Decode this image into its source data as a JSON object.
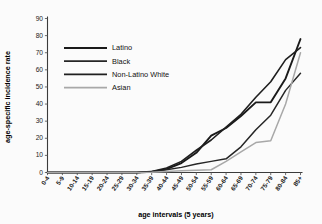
{
  "chart_data": {
    "type": "line",
    "title": "",
    "xlabel": "age intervals (5 years)",
    "ylabel": "age-specific incidence rate",
    "categories": [
      "0-4",
      "5-9",
      "10-14",
      "15-19",
      "20-24",
      "25-29",
      "30-34",
      "35-39",
      "40-44",
      "45-49",
      "50-54",
      "55-59",
      "60-64",
      "65-69",
      "70-74",
      "75-79",
      "80-84",
      "85+"
    ],
    "ylim": [
      0,
      90
    ],
    "yticks": [
      0,
      10,
      20,
      30,
      40,
      50,
      60,
      70,
      80,
      90
    ],
    "grid": false,
    "legend_position": "upper-left-inside",
    "series": [
      {
        "name": "Latino",
        "color": "#1a1a1a",
        "width": 1.9,
        "values": [
          0,
          0,
          0,
          0,
          0,
          0,
          0,
          0.4,
          2.0,
          5.5,
          11.5,
          21.5,
          26.0,
          33.0,
          41.0,
          41.0,
          55.0,
          78.0
        ]
      },
      {
        "name": "Black",
        "color": "#262626",
        "width": 1.5,
        "values": [
          0,
          0,
          0,
          0,
          0,
          0,
          0,
          0.4,
          1.6,
          3.0,
          5.0,
          6.5,
          8.0,
          15.0,
          25.0,
          33.5,
          48.0,
          58.0
        ]
      },
      {
        "name": "Non-Latino White",
        "color": "#1f1f1f",
        "width": 1.6,
        "values": [
          0,
          0,
          0,
          0,
          0,
          0,
          0,
          0.5,
          2.6,
          6.5,
          13.0,
          19.0,
          26.5,
          34.0,
          44.0,
          53.0,
          66.0,
          73.0
        ]
      },
      {
        "name": "Asian",
        "color": "#a8a8a8",
        "width": 1.5,
        "values": [
          0,
          0,
          0,
          0,
          0,
          0,
          0,
          0.2,
          0.6,
          1.0,
          1.3,
          1.6,
          6.5,
          12.0,
          17.5,
          18.5,
          40.0,
          70.0
        ]
      }
    ]
  },
  "legend": {
    "items": [
      {
        "label": "Latino"
      },
      {
        "label": "Black"
      },
      {
        "label": "Non-Latino White"
      },
      {
        "label": "Asian"
      }
    ]
  }
}
